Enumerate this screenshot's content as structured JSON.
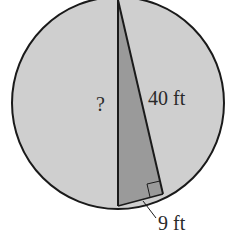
{
  "diagram": {
    "type": "geometry",
    "colors": {
      "circle_fill": "#cfcfcf",
      "triangle_fill": "#9a9a9a",
      "stroke": "#1a1a1a",
      "background": "#ffffff"
    },
    "labels": {
      "unknown_side": "?",
      "hypotenuse_leg": "40 ft",
      "short_leg": "9 ft"
    },
    "right_angle_marker": true
  }
}
